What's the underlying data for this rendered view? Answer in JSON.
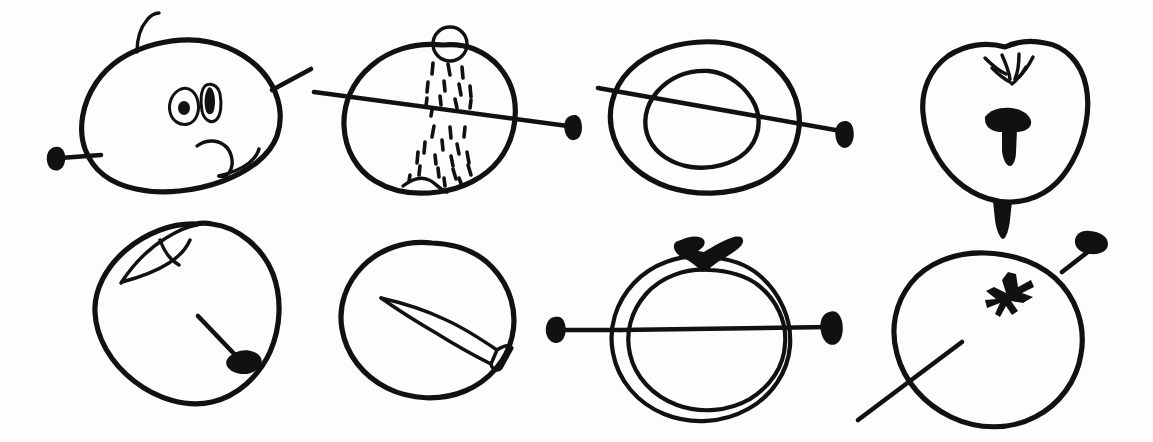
{
  "document": {
    "title": "Hand-drawn apple sketches with nails",
    "medium": "black ink on white paper",
    "background_color": "#fdfdfc",
    "ink_color": "#111111",
    "width": 1153,
    "height": 442,
    "rows": 2,
    "columns": 4,
    "panel_count": 8
  },
  "panels": [
    {
      "id": "panel-1",
      "position": "row-1-col-1",
      "subject": "apple with stem, two seed eyes and a bite notch, nail pierced horizontally",
      "details": [
        "apple outline, tilted",
        "curved stem at top",
        "two eye-like seed shapes with filled pupils",
        "small notch / bite at lower right",
        "nail head at far left, shaft entering left side",
        "nail shaft exiting upper right"
      ]
    },
    {
      "id": "panel-2",
      "position": "row-1-col-2",
      "subject": "apple cut open with small circle at top and many seed speckles, nail through",
      "details": [
        "round apple outline with dimple at bottom",
        "small open circle at top (stem hole)",
        "cluster of short dash speckles in upper half",
        "cluster of short dash speckles in lower half",
        "nail shaft crossing horizontally, head at right"
      ]
    },
    {
      "id": "panel-3",
      "position": "row-1-col-3",
      "subject": "apple cross-section as two concentric ovals with nail through",
      "details": [
        "outer oval ring",
        "inner oval core",
        "nail shaft entering from left, head at right"
      ]
    },
    {
      "id": "panel-4",
      "position": "row-1-col-4",
      "subject": "apple viewed front-on with splayed stem crown, nail head inside and tip exiting bottom",
      "details": [
        "heart-shaped apple outline",
        "splayed crown of short strokes at top dent",
        "filled nail head and shaft in the middle of the apple",
        "nail tip pointing out of the bottom of the apple"
      ]
    },
    {
      "id": "panel-5",
      "position": "row-2-col-1",
      "subject": "apple with leaf at top left and a nail inside pointing down-right",
      "details": [
        "rounded apple outline",
        "pointed leaf at top left",
        "nail shaft angled down-right with head at lower right end"
      ]
    },
    {
      "id": "panel-6",
      "position": "row-2-col-2",
      "subject": "round apple containing a large outlined nail drawn in perspective",
      "details": [
        "circular apple outline",
        "long tapered nail outline inside, point up-left",
        "nail head drawn as small rectangle at lower right of shaft"
      ]
    },
    {
      "id": "panel-7",
      "position": "row-2-col-3",
      "subject": "double outlined circular apple with dark stem and leaves, nail through horizontally",
      "details": [
        "outer circular outline",
        "inner circular outline close to the outer one",
        "filled dark stem with two leaf prongs at the top",
        "nail head at left outside, shaft through to head at right"
      ]
    },
    {
      "id": "panel-8",
      "position": "row-2-col-4",
      "subject": "apple with star mark, nail at upper right and long line through lower left",
      "details": [
        "oval apple outline",
        "filled star / asterisk mark near the top centre",
        "nail with head at upper right entering the apple",
        "long straight line entering from lower left"
      ]
    }
  ]
}
